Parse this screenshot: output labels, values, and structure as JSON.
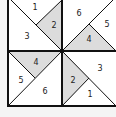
{
  "colors": {
    "background": "#f4f4f4",
    "panel": "#ffffff",
    "shade": "#dcdcdc",
    "line": "#111111"
  },
  "quadrants": {
    "top_left": {
      "labels": [
        "1",
        "2",
        "3"
      ],
      "shaded": "2"
    },
    "top_right": {
      "labels": [
        "6",
        "5",
        "4"
      ],
      "shaded": "4"
    },
    "bottom_left": {
      "labels": [
        "4",
        "5",
        "6"
      ],
      "shaded": "4"
    },
    "bottom_right": {
      "labels": [
        "3",
        "2",
        "1"
      ],
      "shaded": "2"
    }
  }
}
